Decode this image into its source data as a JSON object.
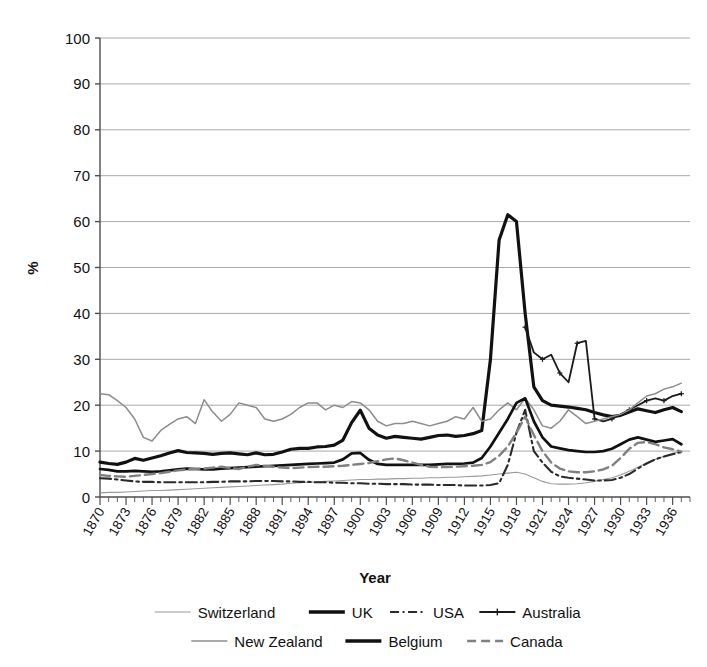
{
  "chart_data": {
    "type": "line",
    "title": "",
    "xlabel": "Year",
    "ylabel": "%",
    "xlim": [
      1870,
      1938
    ],
    "ylim": [
      0,
      100
    ],
    "grid": true,
    "legend_position": "bottom",
    "y_ticks": [
      0,
      10,
      20,
      30,
      40,
      50,
      60,
      70,
      80,
      90,
      100
    ],
    "x_tick_labels": [
      "1870",
      "1873",
      "1876",
      "1879",
      "1882",
      "1885",
      "1888",
      "1891",
      "1894",
      "1897",
      "1900",
      "1903",
      "1906",
      "1909",
      "1912",
      "1915",
      "1918",
      "1921",
      "1924",
      "1927",
      "1930",
      "1933",
      "1936"
    ],
    "x_tick_step": 3,
    "x_minor_tick_step": 1,
    "series": [
      {
        "name": "Switzerland",
        "style": "thin-solid",
        "color": "#9a9a9a",
        "width": 1.1,
        "x": [
          1870,
          1871,
          1872,
          1873,
          1874,
          1875,
          1876,
          1877,
          1878,
          1879,
          1880,
          1881,
          1882,
          1883,
          1884,
          1885,
          1886,
          1887,
          1888,
          1889,
          1890,
          1891,
          1892,
          1893,
          1894,
          1895,
          1896,
          1897,
          1898,
          1899,
          1900,
          1901,
          1902,
          1903,
          1904,
          1905,
          1906,
          1907,
          1908,
          1909,
          1910,
          1911,
          1912,
          1913,
          1914,
          1915,
          1916,
          1917,
          1918,
          1919,
          1920,
          1921,
          1922,
          1923,
          1924,
          1925,
          1926,
          1927,
          1928,
          1929,
          1930,
          1931,
          1932,
          1933,
          1934,
          1935,
          1936,
          1937
        ],
        "values": [
          0.9,
          1.0,
          1.0,
          1.1,
          1.2,
          1.3,
          1.4,
          1.4,
          1.5,
          1.6,
          1.7,
          1.8,
          1.9,
          2.0,
          2.1,
          2.2,
          2.3,
          2.4,
          2.5,
          2.6,
          2.7,
          2.8,
          3.0,
          3.1,
          3.2,
          3.3,
          3.4,
          3.5,
          3.6,
          3.7,
          3.8,
          3.8,
          3.9,
          3.9,
          4.0,
          4.0,
          4.1,
          4.1,
          4.2,
          4.2,
          4.3,
          4.3,
          4.4,
          4.5,
          4.6,
          4.8,
          5.0,
          5.2,
          5.4,
          5.0,
          4.2,
          3.4,
          2.9,
          2.8,
          2.8,
          2.9,
          3.1,
          3.4,
          3.8,
          4.2,
          4.8,
          5.6,
          6.5,
          7.4,
          8.2,
          8.9,
          9.5,
          9.9
        ]
      },
      {
        "name": "UK",
        "style": "thick-solid",
        "color": "#111111",
        "width": 3.2,
        "x": [
          1870,
          1871,
          1872,
          1873,
          1874,
          1875,
          1876,
          1877,
          1878,
          1879,
          1880,
          1881,
          1882,
          1883,
          1884,
          1885,
          1886,
          1887,
          1888,
          1889,
          1890,
          1891,
          1892,
          1893,
          1894,
          1895,
          1896,
          1897,
          1898,
          1899,
          1900,
          1901,
          1902,
          1903,
          1904,
          1905,
          1906,
          1907,
          1908,
          1909,
          1910,
          1911,
          1912,
          1913,
          1914,
          1915,
          1916,
          1917,
          1918,
          1919,
          1920,
          1921,
          1922,
          1923,
          1924,
          1925,
          1926,
          1927,
          1928,
          1929,
          1930,
          1931,
          1932,
          1933,
          1934,
          1935,
          1936,
          1937
        ],
        "values": [
          7.6,
          7.3,
          7.1,
          7.6,
          8.4,
          8.0,
          8.5,
          9.0,
          9.6,
          10.1,
          9.7,
          9.6,
          9.5,
          9.3,
          9.5,
          9.6,
          9.4,
          9.2,
          9.6,
          9.2,
          9.3,
          9.8,
          10.4,
          10.6,
          10.6,
          10.9,
          11.0,
          11.3,
          12.4,
          16.2,
          18.9,
          15.0,
          13.5,
          12.8,
          13.2,
          13.0,
          12.8,
          12.6,
          13.0,
          13.4,
          13.5,
          13.2,
          13.4,
          13.8,
          14.5,
          30.0,
          56.0,
          61.5,
          60.0,
          40.0,
          24.0,
          21.0,
          20.0,
          19.8,
          19.6,
          19.3,
          19.0,
          18.4,
          17.9,
          17.5,
          17.8,
          18.5,
          19.2,
          18.8,
          18.4,
          19.0,
          19.5,
          18.6
        ]
      },
      {
        "name": "USA",
        "style": "dash-dot",
        "color": "#2a2a2a",
        "width": 2.1,
        "x": [
          1870,
          1871,
          1872,
          1873,
          1874,
          1875,
          1876,
          1877,
          1878,
          1879,
          1880,
          1881,
          1882,
          1883,
          1884,
          1885,
          1886,
          1887,
          1888,
          1889,
          1890,
          1891,
          1892,
          1893,
          1894,
          1895,
          1896,
          1897,
          1898,
          1899,
          1900,
          1901,
          1902,
          1903,
          1904,
          1905,
          1906,
          1907,
          1908,
          1909,
          1910,
          1911,
          1912,
          1913,
          1914,
          1915,
          1916,
          1917,
          1918,
          1919,
          1920,
          1921,
          1922,
          1923,
          1924,
          1925,
          1926,
          1927,
          1928,
          1929,
          1930,
          1931,
          1932,
          1933,
          1934,
          1935,
          1936,
          1937
        ],
        "values": [
          4.1,
          4.0,
          3.8,
          3.6,
          3.4,
          3.3,
          3.3,
          3.2,
          3.2,
          3.2,
          3.2,
          3.2,
          3.2,
          3.3,
          3.3,
          3.4,
          3.4,
          3.4,
          3.5,
          3.5,
          3.5,
          3.4,
          3.4,
          3.3,
          3.3,
          3.2,
          3.2,
          3.1,
          3.1,
          3.0,
          3.0,
          2.9,
          2.9,
          2.8,
          2.8,
          2.8,
          2.7,
          2.7,
          2.7,
          2.6,
          2.6,
          2.6,
          2.5,
          2.5,
          2.5,
          2.6,
          3.0,
          7.0,
          14.0,
          19.0,
          10.0,
          7.5,
          5.5,
          4.5,
          4.2,
          4.0,
          3.8,
          3.6,
          3.6,
          3.7,
          4.2,
          5.0,
          6.2,
          7.3,
          8.2,
          8.8,
          9.3,
          9.8
        ]
      },
      {
        "name": "Australia",
        "style": "marker-solid",
        "color": "#1a1a1a",
        "width": 1.8,
        "x": [
          1919,
          1920,
          1921,
          1922,
          1923,
          1924,
          1925,
          1926,
          1927,
          1928,
          1929,
          1930,
          1931,
          1932,
          1933,
          1934,
          1935,
          1936,
          1937
        ],
        "values": [
          37.0,
          31.5,
          30.0,
          31.0,
          27.0,
          25.0,
          33.5,
          34.0,
          17.0,
          16.5,
          17.0,
          18.0,
          19.0,
          20.0,
          21.0,
          21.5,
          21.0,
          22.0,
          22.5
        ]
      },
      {
        "name": "New Zealand",
        "style": "medium-solid",
        "color": "#8c8c8c",
        "width": 1.5,
        "x": [
          1870,
          1871,
          1872,
          1873,
          1874,
          1875,
          1876,
          1877,
          1878,
          1879,
          1880,
          1881,
          1882,
          1883,
          1884,
          1885,
          1886,
          1887,
          1888,
          1889,
          1890,
          1891,
          1892,
          1893,
          1894,
          1895,
          1896,
          1897,
          1898,
          1899,
          1900,
          1901,
          1902,
          1903,
          1904,
          1905,
          1906,
          1907,
          1908,
          1909,
          1910,
          1911,
          1912,
          1913,
          1914,
          1915,
          1916,
          1917,
          1918,
          1919,
          1920,
          1921,
          1922,
          1923,
          1924,
          1925,
          1926,
          1927,
          1928,
          1929,
          1930,
          1931,
          1932,
          1933,
          1934,
          1935,
          1936,
          1937
        ],
        "values": [
          22.5,
          22.3,
          21.0,
          19.5,
          17.0,
          13.0,
          12.2,
          14.5,
          15.8,
          17.0,
          17.5,
          16.0,
          21.2,
          18.5,
          16.5,
          18.0,
          20.5,
          20.0,
          19.5,
          17.0,
          16.5,
          17.0,
          18.0,
          19.5,
          20.5,
          20.5,
          19.0,
          20.0,
          19.5,
          20.8,
          20.5,
          19.0,
          16.5,
          15.5,
          16.0,
          16.0,
          16.5,
          16.0,
          15.5,
          16.0,
          16.5,
          17.5,
          17.0,
          19.5,
          16.5,
          17.0,
          19.0,
          20.5,
          19.0,
          21.5,
          19.0,
          15.5,
          15.0,
          16.5,
          19.0,
          17.5,
          16.0,
          16.5,
          17.0,
          17.5,
          18.0,
          19.0,
          20.5,
          22.0,
          22.5,
          23.5,
          24.0,
          24.8
        ]
      },
      {
        "name": "Belgium",
        "style": "thick-solid",
        "color": "#111111",
        "width": 2.7,
        "x": [
          1870,
          1871,
          1872,
          1873,
          1874,
          1875,
          1876,
          1877,
          1878,
          1879,
          1880,
          1881,
          1882,
          1883,
          1884,
          1885,
          1886,
          1887,
          1888,
          1889,
          1890,
          1891,
          1892,
          1893,
          1894,
          1895,
          1896,
          1897,
          1898,
          1899,
          1900,
          1901,
          1902,
          1903,
          1904,
          1905,
          1906,
          1907,
          1908,
          1909,
          1910,
          1911,
          1912,
          1913,
          1914,
          1915,
          1916,
          1917,
          1918,
          1919,
          1920,
          1921,
          1922,
          1923,
          1924,
          1925,
          1926,
          1927,
          1928,
          1929,
          1930,
          1931,
          1932,
          1933,
          1934,
          1935,
          1936,
          1937
        ],
        "values": [
          6.1,
          5.9,
          5.6,
          5.6,
          5.7,
          5.6,
          5.5,
          5.6,
          5.8,
          6.0,
          6.2,
          6.1,
          6.0,
          6.0,
          6.2,
          6.3,
          6.4,
          6.5,
          6.6,
          6.7,
          6.8,
          6.9,
          7.0,
          7.1,
          7.2,
          7.3,
          7.4,
          7.5,
          8.2,
          9.5,
          9.6,
          8.1,
          7.2,
          7.0,
          7.0,
          7.0,
          7.0,
          7.0,
          7.0,
          7.1,
          7.2,
          7.2,
          7.3,
          7.5,
          8.5,
          11.0,
          14.0,
          17.0,
          20.5,
          21.5,
          16.5,
          13.0,
          11.0,
          10.6,
          10.2,
          10.0,
          9.8,
          9.8,
          10.0,
          10.5,
          11.5,
          12.5,
          13.0,
          12.5,
          12.0,
          12.3,
          12.6,
          11.5
        ]
      },
      {
        "name": "Canada",
        "style": "dashed",
        "color": "#808080",
        "width": 2.4,
        "x": [
          1870,
          1871,
          1872,
          1873,
          1874,
          1875,
          1876,
          1877,
          1878,
          1879,
          1880,
          1881,
          1882,
          1883,
          1884,
          1885,
          1886,
          1887,
          1888,
          1889,
          1890,
          1891,
          1892,
          1893,
          1894,
          1895,
          1896,
          1897,
          1898,
          1899,
          1900,
          1901,
          1902,
          1903,
          1904,
          1905,
          1906,
          1907,
          1908,
          1909,
          1910,
          1911,
          1912,
          1913,
          1914,
          1915,
          1916,
          1917,
          1918,
          1919,
          1920,
          1921,
          1922,
          1923,
          1924,
          1925,
          1926,
          1927,
          1928,
          1929,
          1930,
          1931,
          1932,
          1933,
          1934,
          1935,
          1936,
          1937
        ],
        "values": [
          4.8,
          4.6,
          4.5,
          4.4,
          4.6,
          4.8,
          5.0,
          5.2,
          5.5,
          5.8,
          6.0,
          6.1,
          6.2,
          6.4,
          6.6,
          6.3,
          6.1,
          6.6,
          7.0,
          6.8,
          6.6,
          6.4,
          6.3,
          6.4,
          6.5,
          6.6,
          6.6,
          6.7,
          6.8,
          7.0,
          7.2,
          7.4,
          7.8,
          8.2,
          8.4,
          8.0,
          7.5,
          7.0,
          6.6,
          6.5,
          6.5,
          6.6,
          6.7,
          6.8,
          7.0,
          7.6,
          9.0,
          11.0,
          14.0,
          17.5,
          13.5,
          10.0,
          7.5,
          6.2,
          5.6,
          5.4,
          5.4,
          5.6,
          6.0,
          6.8,
          8.5,
          10.5,
          11.8,
          12.0,
          11.5,
          10.8,
          10.4,
          9.9
        ]
      }
    ]
  },
  "legend": {
    "rows": [
      [
        {
          "label": "Switzerland",
          "swatch": "thin-solid-gray"
        },
        {
          "label": "UK",
          "swatch": "thick-solid-black"
        },
        {
          "label": "USA",
          "swatch": "dash-dot-black"
        },
        {
          "label": "Australia",
          "swatch": "marker-line-black"
        }
      ],
      [
        {
          "label": "New Zealand",
          "swatch": "medium-solid-gray"
        },
        {
          "label": "Belgium",
          "swatch": "thick-solid-black"
        },
        {
          "label": "Canada",
          "swatch": "dashed-gray"
        }
      ]
    ]
  },
  "colors": {
    "axis": "#4d4d4d",
    "grid": "#a8a8a8",
    "text": "#111111",
    "background": "#ffffff"
  }
}
